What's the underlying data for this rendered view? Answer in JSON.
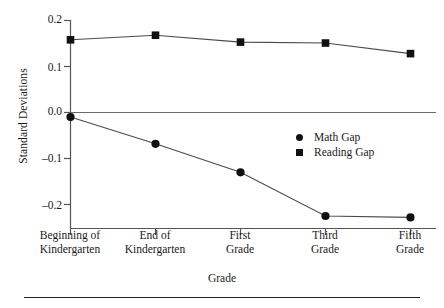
{
  "chart_data": {
    "type": "line",
    "title": "",
    "subtitle": "",
    "xlabel": "Grade",
    "ylabel": "Standard Deviations",
    "categories": [
      "Beginning of\nKindergarten",
      "End of\nKindergarten",
      "First\nGrade",
      "Third\nGrade",
      "Fifth\nGrade"
    ],
    "series": [
      {
        "name": "Math Gap",
        "marker": "circle",
        "color": "#111111",
        "values": [
          -0.01,
          -0.068,
          -0.13,
          -0.225,
          -0.228
        ]
      },
      {
        "name": "Reading Gap",
        "marker": "square",
        "color": "#111111",
        "values": [
          0.158,
          0.168,
          0.153,
          0.151,
          0.128
        ]
      }
    ],
    "ylim": [
      -0.23,
      0.2
    ],
    "yticks": [
      0.2,
      0.1,
      0.0,
      -0.1,
      -0.2
    ],
    "ytick_labels": [
      "0.2",
      "0.1",
      "0.0",
      "–0.1",
      "–0.2"
    ],
    "zero_line": true,
    "grid": false,
    "legend_position": "center-right"
  },
  "legend": {
    "items": [
      {
        "label": "Math Gap",
        "marker": "circle"
      },
      {
        "label": "Reading Gap",
        "marker": "square"
      }
    ]
  },
  "colors": {
    "ink": "#111111",
    "axis": "#555555",
    "rule": "#222222",
    "background": "#ffffff"
  }
}
